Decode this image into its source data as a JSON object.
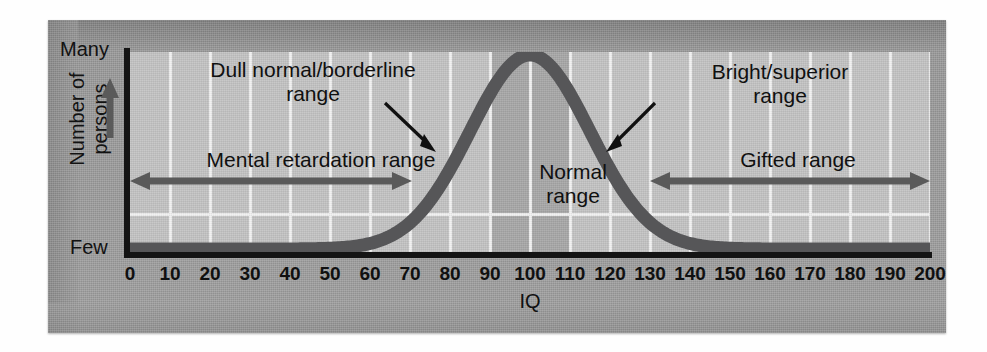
{
  "figure": {
    "type": "distribution-curve",
    "caption": ""
  },
  "axes": {
    "y_top_label": "Many",
    "y_bottom_label": "Few",
    "y_axis_title": "Number of\npersons",
    "y_axis_title_line1": "Number of",
    "y_axis_title_line2": "persons",
    "y_arrow_icon": "up-arrow-icon",
    "x_axis_title": "IQ",
    "x_ticks": [
      0,
      10,
      20,
      30,
      40,
      50,
      60,
      70,
      80,
      90,
      100,
      110,
      120,
      130,
      140,
      150,
      160,
      170,
      180,
      190,
      200
    ]
  },
  "annotations": {
    "dull_normal": {
      "line1": "Dull normal/borderline",
      "line2": "range",
      "pointer_icon": "pointer-arrow-down-right-icon"
    },
    "bright_superior": {
      "line1": "Bright/superior",
      "line2": "range",
      "pointer_icon": "pointer-arrow-down-left-icon"
    },
    "normal_range": {
      "line1": "Normal",
      "line2": "range",
      "band_start": 90,
      "band_end": 110
    },
    "mental_retardation": {
      "label": "Mental retardation range",
      "arrow_icon": "double-headed-arrow-icon",
      "range_start": 0,
      "range_end": 70
    },
    "gifted": {
      "label": "Gifted range",
      "arrow_icon": "double-headed-arrow-icon",
      "range_start": 130,
      "range_end": 200
    }
  },
  "colors": {
    "curve": "#565658",
    "plot_background": "#c4c4c4",
    "normal_band": "#a8a8a8",
    "gridline": "#f2f2f2",
    "axis": "#141414",
    "frame": "#9a9a9a",
    "text": "#121212"
  },
  "chart_data": {
    "type": "line",
    "title": "",
    "xlabel": "IQ",
    "ylabel": "Number of persons",
    "xlim": [
      0,
      200
    ],
    "ylim": [
      0,
      1
    ],
    "grid": true,
    "legend": "none",
    "distribution": {
      "name": "IQ normal distribution",
      "mean": 100,
      "std": 15,
      "peak_x": 100
    },
    "x": [
      0,
      10,
      20,
      30,
      40,
      50,
      60,
      70,
      80,
      90,
      100,
      110,
      120,
      130,
      140,
      150,
      160,
      170,
      180,
      190,
      200
    ],
    "y": [
      0.0,
      0.0,
      0.0,
      0.0,
      0.001,
      0.004,
      0.016,
      0.055,
      0.264,
      0.741,
      1.0,
      0.741,
      0.264,
      0.055,
      0.016,
      0.004,
      0.001,
      0.0,
      0.0,
      0.0,
      0.0
    ],
    "annotations": [
      {
        "text": "Dull normal/borderline range",
        "x": 75,
        "kind": "pointer"
      },
      {
        "text": "Normal range",
        "x": 100,
        "kind": "band",
        "x_start": 90,
        "x_end": 110
      },
      {
        "text": "Bright/superior range",
        "x": 125,
        "kind": "pointer"
      },
      {
        "text": "Mental retardation range",
        "x_start": 0,
        "x_end": 70,
        "kind": "span-arrow"
      },
      {
        "text": "Gifted range",
        "x_start": 130,
        "x_end": 200,
        "kind": "span-arrow"
      }
    ],
    "ytick_labels": [
      "Few",
      "Many"
    ]
  }
}
